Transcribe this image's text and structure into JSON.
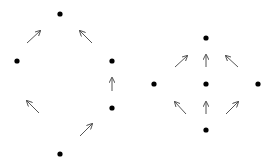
{
  "colors": {
    "background": "#ffffff",
    "node": "#000000",
    "edge": "#555555"
  },
  "diagrams": [
    {
      "name": "left-lattice",
      "nodes": [
        {
          "id": "top",
          "x": 60,
          "y": 14
        },
        {
          "id": "left",
          "x": 17,
          "y": 61
        },
        {
          "id": "right-upper",
          "x": 112,
          "y": 61
        },
        {
          "id": "right-lower",
          "x": 112,
          "y": 108
        },
        {
          "id": "bottom",
          "x": 60,
          "y": 154
        }
      ],
      "arrows": [
        {
          "x1": 27,
          "y1": 43,
          "x2": 40,
          "y2": 31
        },
        {
          "x1": 92,
          "y1": 43,
          "x2": 80,
          "y2": 31
        },
        {
          "x1": 112,
          "y1": 91,
          "x2": 112,
          "y2": 78
        },
        {
          "x1": 39,
          "y1": 113,
          "x2": 27,
          "y2": 101
        },
        {
          "x1": 80,
          "y1": 136,
          "x2": 92,
          "y2": 124
        }
      ]
    },
    {
      "name": "right-lattice",
      "nodes": [
        {
          "id": "top",
          "x": 206,
          "y": 38
        },
        {
          "id": "left",
          "x": 154,
          "y": 84
        },
        {
          "id": "center",
          "x": 206,
          "y": 84
        },
        {
          "id": "right",
          "x": 258,
          "y": 84
        },
        {
          "id": "bottom",
          "x": 206,
          "y": 130
        }
      ],
      "arrows": [
        {
          "x1": 175,
          "y1": 67,
          "x2": 187,
          "y2": 56
        },
        {
          "x1": 206,
          "y1": 67,
          "x2": 206,
          "y2": 55
        },
        {
          "x1": 238,
          "y1": 67,
          "x2": 226,
          "y2": 56
        },
        {
          "x1": 186,
          "y1": 114,
          "x2": 175,
          "y2": 102
        },
        {
          "x1": 206,
          "y1": 114,
          "x2": 206,
          "y2": 102
        },
        {
          "x1": 226,
          "y1": 114,
          "x2": 238,
          "y2": 102
        }
      ]
    }
  ]
}
